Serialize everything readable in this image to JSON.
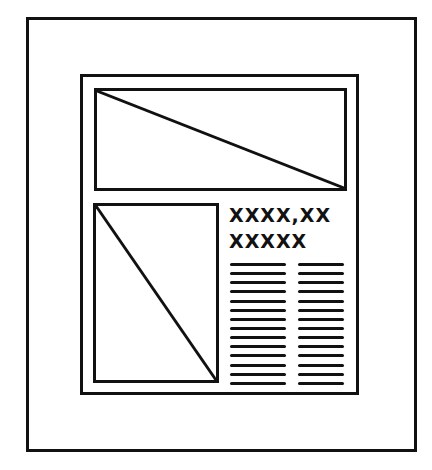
{
  "layout_sketch": {
    "page": {
      "description": "page frame"
    },
    "content_block": {
      "top_image": {
        "placeholder": "image placeholder with diagonal"
      },
      "left_image": {
        "placeholder": "image placeholder with diagonal"
      },
      "headline": {
        "line1": "XXXX,XX",
        "line2": "XXXXX"
      },
      "text_columns": [
        {
          "line_count": 14
        },
        {
          "line_count": 14
        }
      ]
    }
  },
  "colors": {
    "ink": "#111111",
    "paper": "#ffffff"
  }
}
